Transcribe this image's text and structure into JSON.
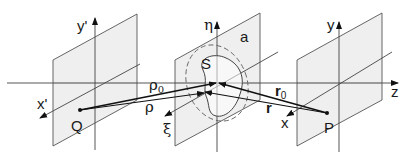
{
  "diagram": {
    "colors": {
      "plane_fill": "#ececec",
      "plane_edge": "#555555",
      "line": "#333333",
      "vector": "#111111"
    },
    "planes": [
      {
        "name": "source-plane",
        "axis_vertical": "y'",
        "axis_diagonal": "x'",
        "point": "Q"
      },
      {
        "name": "aperture-plane",
        "axis_vertical": "η",
        "axis_diagonal": "ξ",
        "aperture": "S",
        "radius_label": "a"
      },
      {
        "name": "observation-plane",
        "axis_vertical": "y",
        "axis_diagonal": "x",
        "point": "P"
      }
    ],
    "labels": {
      "y_prime": "y'",
      "x_prime": "x'",
      "Q": "Q",
      "eta": "η",
      "xi": "ξ",
      "a": "a",
      "S": "S",
      "rho0": "ρ",
      "rho0_sub": "0",
      "rho": "ρ",
      "r0": "r",
      "r0_sub": "0",
      "r": "r",
      "y": "y",
      "x": "x",
      "P": "P",
      "z": "z"
    }
  }
}
